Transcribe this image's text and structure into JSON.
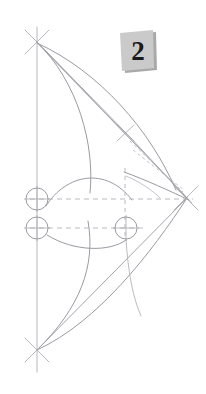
{
  "figure": {
    "title": "",
    "step_label": "2",
    "background_color": "#ffffff",
    "line_color": "#9a9aa2",
    "construction_line_color": "#b9b9c0",
    "dashed_line_color": "#b2b2ba",
    "badge_fill_color": "#c9c9c9",
    "badge_shadow_color": "#a8a8a8"
  },
  "geometry": {
    "axis": {
      "name": "vertical-center-axis",
      "x": 37,
      "y_top": 27,
      "y_bottom": 372
    },
    "vertices": [
      {
        "name": "top-vertex",
        "x": 37,
        "y": 42,
        "marker": "cross-x"
      },
      {
        "name": "bottom-vertex",
        "x": 37,
        "y": 350,
        "marker": "cross-x"
      },
      {
        "name": "right-vertex",
        "x": 186,
        "y": 198,
        "marker": "cross-x"
      },
      {
        "name": "upper-node",
        "x": 125,
        "y": 132,
        "marker": "cross-x"
      }
    ],
    "circles": [
      {
        "name": "circle-upper-left",
        "cx": 37,
        "cy": 199,
        "r": 11,
        "crosshair": true
      },
      {
        "name": "circle-lower-left",
        "cx": 37,
        "cy": 228,
        "r": 11,
        "crosshair": true
      },
      {
        "name": "circle-mid-right",
        "cx": 126,
        "cy": 228,
        "r": 11,
        "crosshair": true
      }
    ],
    "dashed_lines": [
      {
        "name": "dashed-horizontal-upper",
        "x1": 30,
        "y1": 199,
        "x2": 192,
        "y2": 199
      },
      {
        "name": "dashed-horizontal-lower",
        "x1": 30,
        "y1": 228,
        "x2": 142,
        "y2": 228
      },
      {
        "name": "dashed-vertical-tick",
        "x1": 125,
        "y1": 170,
        "x2": 125,
        "y2": 240
      }
    ],
    "dashed_rays": [
      {
        "name": "dashed-ray-a",
        "x1": 128,
        "y1": 142,
        "x2": 183,
        "y2": 193
      },
      {
        "name": "dashed-ray-b",
        "x1": 130,
        "y1": 150,
        "x2": 183,
        "y2": 191
      }
    ],
    "straight_lines": [
      {
        "name": "line-top-to-node",
        "x1": 37,
        "y1": 42,
        "x2": 125,
        "y2": 132
      },
      {
        "name": "line-top-to-right",
        "x1": 37,
        "y1": 42,
        "x2": 186,
        "y2": 198
      },
      {
        "name": "line-node-to-right",
        "x1": 125,
        "y1": 132,
        "x2": 186,
        "y2": 198
      },
      {
        "name": "line-bottom-to-right",
        "x1": 37,
        "y1": 350,
        "x2": 186,
        "y2": 198
      },
      {
        "name": "line-axis-vertical",
        "x1": 37,
        "y1": 27,
        "x2": 37,
        "y2": 372
      }
    ],
    "curves": [
      {
        "name": "curve-upper-limb-outer",
        "d": "M 37 42 C 85 95 95 160 90 192"
      },
      {
        "name": "curve-upper-limb-inner",
        "d": "M 37 42 C 105 80 145 135 170 185"
      },
      {
        "name": "curve-upper-spine",
        "d": "M 46 207 C 70 172 110 168 135 205"
      },
      {
        "name": "curve-upper-tip",
        "d": "M 126 174 C 150 182 172 191 188 199"
      },
      {
        "name": "curve-lower-limb-outer",
        "d": "M 37 350 C 85 300 95 265 88 221"
      },
      {
        "name": "curve-lower-limb-inner",
        "d": "M 37 350 C 95 320 150 250 186 198"
      },
      {
        "name": "curve-lower-spine",
        "d": "M 47 236 C 75 250 110 250 127 239"
      },
      {
        "name": "curve-node-drop",
        "d": "M 125 239 C 127 275 133 300 140 318"
      }
    ],
    "cross_marks": [
      {
        "name": "cross-mark-top",
        "x": 37,
        "y": 42,
        "size": 13
      },
      {
        "name": "cross-mark-bottom",
        "x": 37,
        "y": 350,
        "size": 13
      },
      {
        "name": "cross-mark-right",
        "x": 186,
        "y": 198,
        "size": 13
      },
      {
        "name": "cross-mark-node",
        "x": 125,
        "y": 132,
        "size": 9
      }
    ]
  },
  "badge": {
    "label": "2",
    "left": 117,
    "top": 30,
    "skew_x_deg": -5,
    "rotate_deg": 3
  }
}
